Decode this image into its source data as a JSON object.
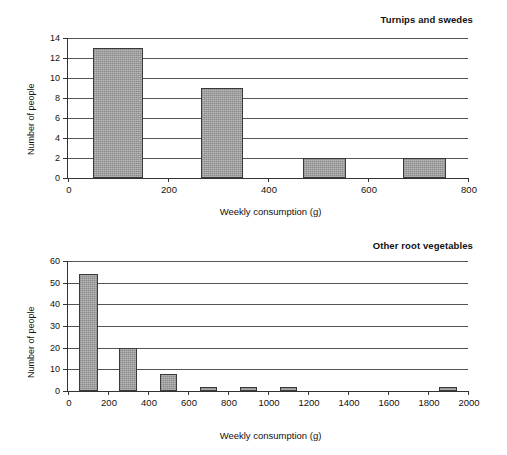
{
  "page": {
    "axis_label_x": "Weekly consumption (g)",
    "axis_label_y": "Number of people"
  },
  "chart_data": [
    {
      "type": "bar",
      "title": "Turnips and swedes",
      "xlabel": "Weekly consumption (g)",
      "ylabel": "Number of people",
      "xlim": [
        0,
        800
      ],
      "ylim": [
        0,
        14
      ],
      "xticks": [
        0,
        200,
        400,
        600,
        800
      ],
      "yticks": [
        0,
        2,
        4,
        6,
        8,
        10,
        12,
        14
      ],
      "xtick_labels": [
        "0",
        "200",
        "400",
        "600",
        "800"
      ],
      "ytick_labels": [
        "0",
        "2",
        "4",
        "6",
        "8",
        "10",
        "12",
        "14"
      ],
      "grid": "horizontal",
      "legend": "none",
      "bars": [
        {
          "bin_start": 50,
          "bin_end": 150,
          "value": 13
        },
        {
          "bin_start": 265,
          "bin_end": 350,
          "value": 9
        },
        {
          "bin_start": 470,
          "bin_end": 555,
          "value": 2
        },
        {
          "bin_start": 670,
          "bin_end": 755,
          "value": 2
        }
      ],
      "categories": [
        "50-150",
        "265-350",
        "470-555",
        "670-755"
      ],
      "values": [
        13,
        9,
        2,
        2
      ]
    },
    {
      "type": "bar",
      "title": "Other root vegetables",
      "xlabel": "Weekly consumption (g)",
      "ylabel": "Number of people",
      "xlim": [
        0,
        2000
      ],
      "ylim": [
        0,
        60
      ],
      "xticks": [
        0,
        200,
        400,
        600,
        800,
        1000,
        1200,
        1400,
        1600,
        1800,
        2000
      ],
      "yticks": [
        0,
        10,
        20,
        30,
        40,
        50,
        60
      ],
      "xtick_labels": [
        "0",
        "200",
        "400",
        "600",
        "800",
        "1000",
        "1200",
        "1400",
        "1600",
        "1800",
        "2000"
      ],
      "ytick_labels": [
        "0",
        "10",
        "20",
        "30",
        "40",
        "50",
        "60"
      ],
      "grid": "horizontal",
      "legend": "none",
      "bars": [
        {
          "bin_start": 55,
          "bin_end": 150,
          "value": 54
        },
        {
          "bin_start": 255,
          "bin_end": 345,
          "value": 20
        },
        {
          "bin_start": 460,
          "bin_end": 545,
          "value": 8
        },
        {
          "bin_start": 660,
          "bin_end": 745,
          "value": 2
        },
        {
          "bin_start": 860,
          "bin_end": 945,
          "value": 2
        },
        {
          "bin_start": 1060,
          "bin_end": 1145,
          "value": 2
        },
        {
          "bin_start": 1855,
          "bin_end": 1945,
          "value": 2
        }
      ],
      "categories": [
        "55-150",
        "255-345",
        "460-545",
        "660-745",
        "860-945",
        "1060-1145",
        "1855-1945"
      ],
      "values": [
        54,
        20,
        8,
        2,
        2,
        2,
        2
      ]
    }
  ]
}
